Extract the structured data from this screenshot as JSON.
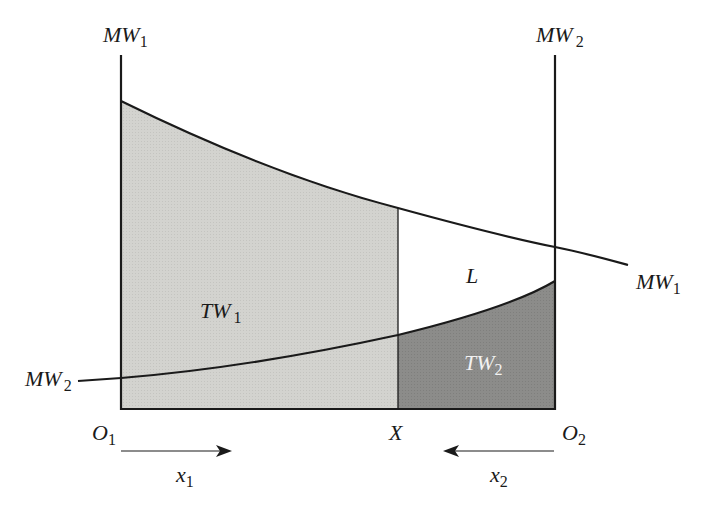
{
  "diagram": {
    "type": "two-sector wage allocation diagram",
    "colors": {
      "tw1_fill": "#d3d3cf",
      "tw2_fill": "#8c8c8a",
      "loss_fill": "#ffffff",
      "lines": "#1a1a1a"
    },
    "labels": {
      "mw1_top": {
        "main": "MW",
        "sub": "1"
      },
      "mw2_top": {
        "main": "MW",
        "sub": "2"
      },
      "mw1_curve": {
        "main": "MW",
        "sub": "1"
      },
      "mw2_curve": {
        "main": "MW",
        "sub": "2"
      },
      "tw1": {
        "main": "TW",
        "sub": "1"
      },
      "tw2": {
        "main": "TW",
        "sub": "2"
      },
      "loss": "L",
      "origin1": {
        "main": "O",
        "sub": "1"
      },
      "origin2": {
        "main": "O",
        "sub": "2"
      },
      "allocation_point": "X",
      "x1": {
        "main": "x",
        "sub": "1"
      },
      "x2": {
        "main": "x",
        "sub": "2"
      }
    },
    "arrows": [
      {
        "name": "x1-direction",
        "direction": "right"
      },
      {
        "name": "x2-direction",
        "direction": "left"
      }
    ]
  }
}
